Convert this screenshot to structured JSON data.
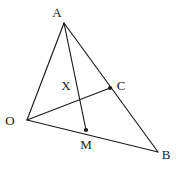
{
  "figure": {
    "kind": "geometry-diagram",
    "background_color": "#ffffff",
    "line_color": "#1a1a1a",
    "label_color": "#1a1a1a",
    "canvas": {
      "width": 176,
      "height": 170
    },
    "points": [
      {
        "id": "A",
        "label": "A",
        "x": 64,
        "y": 23,
        "label_x": 57,
        "label_y": 12,
        "dot": false
      },
      {
        "id": "O",
        "label": "O",
        "x": 27,
        "y": 120,
        "label_x": 10,
        "label_y": 120,
        "dot": false
      },
      {
        "id": "B",
        "label": "B",
        "x": 158,
        "y": 152,
        "label_x": 166,
        "label_y": 154,
        "dot": false
      },
      {
        "id": "C",
        "label": "C",
        "x": 110,
        "y": 88,
        "label_x": 121,
        "label_y": 85,
        "dot": true
      },
      {
        "id": "M",
        "label": "M",
        "x": 86,
        "y": 130,
        "label_x": 86,
        "label_y": 144,
        "dot": true
      },
      {
        "id": "X",
        "label": "X",
        "x": 79,
        "y": 96,
        "label_x": 66,
        "label_y": 85,
        "dot": false
      }
    ],
    "segments": [
      {
        "id": "OA",
        "from": "O",
        "to": "A"
      },
      {
        "id": "AB",
        "from": "A",
        "to": "B"
      },
      {
        "id": "OB",
        "from": "O",
        "to": "B"
      },
      {
        "id": "AM",
        "from": "A",
        "to": "M"
      },
      {
        "id": "OC",
        "from": "O",
        "to": "C"
      }
    ]
  }
}
